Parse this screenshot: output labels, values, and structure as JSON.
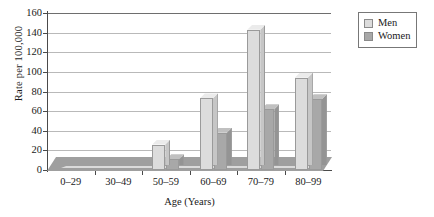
{
  "chart_data": {
    "type": "bar",
    "title": "",
    "xlabel": "Age (Years)",
    "ylabel": "Rate per 100,000",
    "categories": [
      "0–29",
      "30–49",
      "50–59",
      "60–69",
      "70–79",
      "80–99"
    ],
    "series": [
      {
        "name": "Men",
        "values": [
          0,
          0,
          26,
          73,
          143,
          94
        ],
        "color": "#dcdcdc"
      },
      {
        "name": "Women",
        "values": [
          0,
          0,
          11,
          38,
          62,
          72
        ],
        "color": "#a8a8a8"
      }
    ],
    "ylim": [
      0,
      160
    ],
    "ytick_values": [
      0,
      20,
      40,
      60,
      80,
      100,
      120,
      140,
      160
    ],
    "ytick_labels": [
      "0",
      "20",
      "40",
      "60",
      "80",
      "100",
      "120",
      "140",
      "160"
    ],
    "grid": true,
    "legend_position": "top-right",
    "style": "3d-bar"
  },
  "legend": {
    "items": [
      {
        "label": "Men",
        "color": "#dcdcdc"
      },
      {
        "label": "Women",
        "color": "#a8a8a8"
      }
    ]
  },
  "colors": {
    "men_bar": "#dcdcdc",
    "women_bar": "#a8a8a8",
    "gridline": "#b9b9b9",
    "axis": "#4a4a4a",
    "floor": "#9f9f9f",
    "background": "#ffffff"
  }
}
